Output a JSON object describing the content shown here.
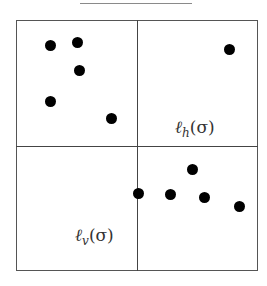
{
  "caption": "",
  "grid": {
    "divider_x": 137,
    "divider_y": 146
  },
  "labels": {
    "horizontal": {
      "ell": "ℓ",
      "sub": "h",
      "arg": "(σ)"
    },
    "vertical": {
      "ell": "ℓ",
      "sub": "v",
      "arg": "(σ)"
    }
  },
  "points": [
    {
      "x": 50,
      "y": 45
    },
    {
      "x": 77,
      "y": 42
    },
    {
      "x": 79,
      "y": 70
    },
    {
      "x": 50,
      "y": 101
    },
    {
      "x": 111,
      "y": 118
    },
    {
      "x": 229,
      "y": 49
    },
    {
      "x": 138,
      "y": 193
    },
    {
      "x": 170,
      "y": 194
    },
    {
      "x": 192,
      "y": 169
    },
    {
      "x": 204,
      "y": 197
    },
    {
      "x": 239,
      "y": 206
    }
  ]
}
